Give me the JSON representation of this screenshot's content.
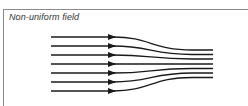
{
  "figure": {
    "title": "Non-uniform field",
    "line_color": "#1a1a1a",
    "border_color": "#8a8a8a",
    "field_lines": {
      "count": 7,
      "start_x": 51,
      "arrow_x": 115,
      "end_x": 213,
      "start_y": [
        37,
        46,
        55,
        64,
        73,
        82,
        91
      ],
      "end_y": [
        50,
        54.5,
        59,
        64,
        68.5,
        73,
        77.5
      ]
    }
  }
}
